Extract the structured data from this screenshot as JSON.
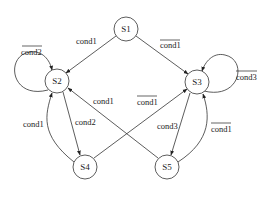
{
  "diagram": {
    "type": "state-transition",
    "nodes": [
      {
        "id": "S1",
        "label": "S1",
        "x": 126,
        "y": 29
      },
      {
        "id": "S2",
        "label": "S2",
        "x": 57,
        "y": 81
      },
      {
        "id": "S3",
        "label": "S3",
        "x": 197,
        "y": 82
      },
      {
        "id": "S4",
        "label": "S4",
        "x": 85,
        "y": 167
      },
      {
        "id": "S5",
        "label": "S5",
        "x": 167,
        "y": 167
      }
    ],
    "edges": [
      {
        "from": "S1",
        "to": "S2",
        "label": "cond1",
        "negated": false
      },
      {
        "from": "S1",
        "to": "S3",
        "label": "cond1",
        "negated": true
      },
      {
        "from": "S2",
        "to": "S2",
        "label": "cond2",
        "negated": true
      },
      {
        "from": "S3",
        "to": "S3",
        "label": "cond3",
        "negated": true
      },
      {
        "from": "S2",
        "to": "S4",
        "label": "cond2",
        "negated": false
      },
      {
        "from": "S4",
        "to": "S2",
        "label": "cond1",
        "negated": false
      },
      {
        "from": "S3",
        "to": "S5",
        "label": "cond3",
        "negated": false
      },
      {
        "from": "S5",
        "to": "S3",
        "label": "cond1",
        "negated": true
      },
      {
        "from": "S5",
        "to": "S2",
        "label": "cond1",
        "negated": false
      },
      {
        "from": "S4",
        "to": "S3",
        "label": "cond1",
        "negated": true
      }
    ]
  },
  "labels": {
    "s1": "S1",
    "s2": "S2",
    "s3": "S3",
    "s4": "S4",
    "s5": "S5",
    "e_s1_s2": "cond1",
    "e_s1_s3": "cond1",
    "e_s2_s2": "cond2",
    "e_s3_s3": "cond3",
    "e_s2_s4": "cond2",
    "e_s4_s2": "cond1",
    "e_s3_s5": "cond3",
    "e_s5_s3": "cond1",
    "e_s5_s2": "cond1",
    "e_s4_s3": "cond1"
  }
}
